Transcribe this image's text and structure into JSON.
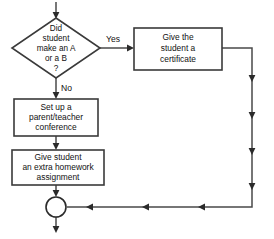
{
  "diagram": {
    "type": "flowchart",
    "background_color": "#ffffff",
    "line_color": "#4a4a4a",
    "text_color": "#111111"
  },
  "nodes": {
    "decision": {
      "shape": "diamond",
      "lines": [
        "Did",
        "student",
        "make an A",
        "or a B",
        "?"
      ]
    },
    "certificate": {
      "shape": "rectangle",
      "lines": [
        "Give the",
        "student a",
        "certificate"
      ]
    },
    "conference": {
      "shape": "rectangle",
      "lines": [
        "Set up a",
        "parent/teacher",
        "conference"
      ]
    },
    "homework": {
      "shape": "rectangle",
      "lines": [
        "Give student",
        "an extra homework",
        "assignment"
      ]
    },
    "merge": {
      "shape": "circle",
      "label": ""
    }
  },
  "edge_labels": {
    "yes": "Yes",
    "no": "No"
  }
}
